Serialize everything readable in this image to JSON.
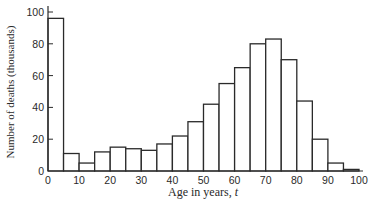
{
  "chart_data": {
    "type": "bar",
    "subtype": "histogram",
    "title": "",
    "xlabel": "Age in years, t",
    "xlabel_parts": {
      "text": "Age in years, ",
      "var": "t"
    },
    "ylabel": "Number of deaths (thousands)",
    "bin_width": 5,
    "bin_edges": [
      0,
      5,
      10,
      15,
      20,
      25,
      30,
      35,
      40,
      45,
      50,
      55,
      60,
      65,
      70,
      75,
      80,
      85,
      90,
      95,
      100
    ],
    "categories": [
      "0-5",
      "5-10",
      "10-15",
      "15-20",
      "20-25",
      "25-30",
      "30-35",
      "35-40",
      "40-45",
      "45-50",
      "50-55",
      "55-60",
      "60-65",
      "65-70",
      "70-75",
      "75-80",
      "80-85",
      "85-90",
      "90-95",
      "95-100"
    ],
    "values": [
      96,
      11,
      5,
      12,
      15,
      14,
      13,
      17,
      22,
      31,
      42,
      55,
      65,
      80,
      83,
      70,
      44,
      20,
      5,
      1
    ],
    "xlim": [
      0,
      100
    ],
    "ylim": [
      0,
      100
    ],
    "xticks": [
      0,
      10,
      20,
      30,
      40,
      50,
      60,
      70,
      80,
      90,
      100
    ],
    "yticks": [
      0,
      20,
      40,
      60,
      80,
      100
    ],
    "grid": false,
    "legend": null,
    "colors": {
      "bar_fill": "#ffffff",
      "bar_stroke": "#2a2a2a",
      "axis": "#2a2a2a"
    }
  }
}
